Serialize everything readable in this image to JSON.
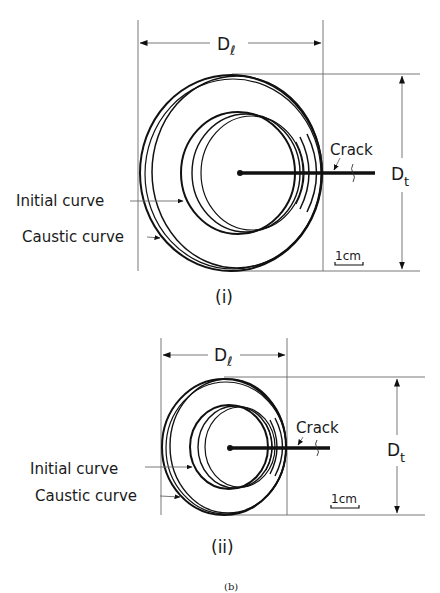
{
  "figure": {
    "caption": "(b)",
    "panels": [
      {
        "id": "i",
        "label": "(i)",
        "dim_longitudinal": "D",
        "dim_longitudinal_sub": "ℓ",
        "dim_transverse": "D",
        "dim_transverse_sub": "t",
        "crack_label": "Crack",
        "initial_curve_label": "Initial curve",
        "caustic_curve_label": "Caustic curve",
        "scale_label": "1cm"
      },
      {
        "id": "ii",
        "label": "(ii)",
        "dim_longitudinal": "D",
        "dim_longitudinal_sub": "ℓ",
        "dim_transverse": "D",
        "dim_transverse_sub": "t",
        "crack_label": "Crack",
        "initial_curve_label": "Initial curve",
        "caustic_curve_label": "Caustic curve",
        "scale_label": "1cm"
      }
    ]
  }
}
